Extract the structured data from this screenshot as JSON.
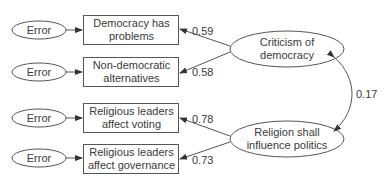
{
  "diagram": {
    "type": "structural-equation-model",
    "error_label": "Error",
    "indicators": [
      {
        "label": "Democracy has problems",
        "line1": "Democracy has",
        "line2": "problems",
        "loading": "0.59",
        "factor": "Criticism of democracy"
      },
      {
        "label": "Non-democratic alternatives",
        "line1": "Non-democratic",
        "line2": "alternatives",
        "loading": "0.58",
        "factor": "Criticism of democracy"
      },
      {
        "label": "Religious leaders affect voting",
        "line1": "Religious leaders",
        "line2": "affect voting",
        "loading": "0.78",
        "factor": "Religion shall influence politics"
      },
      {
        "label": "Religious leaders affect governance",
        "line1": "Religious leaders",
        "line2": "affect governance",
        "loading": "0.73",
        "factor": "Religion shall influence politics"
      }
    ],
    "factors": [
      {
        "label": "Criticism of democracy",
        "line1": "Criticism of",
        "line2": "democracy"
      },
      {
        "label": "Religion shall influence politics",
        "line1": "Religion shall",
        "line2": "influence politics"
      }
    ],
    "correlation": {
      "value": "0.17",
      "between": [
        "Criticism of democracy",
        "Religion shall influence politics"
      ]
    },
    "colors": {
      "stroke": "#444444",
      "text": "#3a3a3a",
      "background": "#ffffff"
    }
  }
}
